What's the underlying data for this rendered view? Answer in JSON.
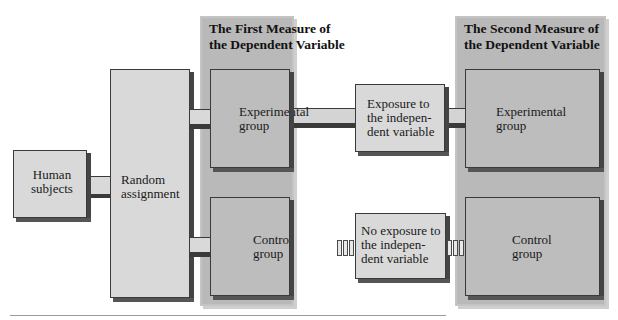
{
  "diagram": {
    "type": "experimental-design-flowchart",
    "nodes": {
      "human_subjects": "Human subjects",
      "random_assignment": "Random assignment",
      "first_measure": {
        "title_line1": "The First Measure of",
        "title_line2": "the Dependent Variable",
        "experimental_line1": "Experimental",
        "experimental_line2": "group",
        "control_line1": "Control",
        "control_line2": "group"
      },
      "exposure": {
        "line1": "Exposure to",
        "line2": "the indepen-",
        "line3": "dent variable"
      },
      "no_exposure": {
        "line1": "No exposure to",
        "line2": "the indepen-",
        "line3": "dent variable"
      },
      "second_measure": {
        "title_line1": "The Second Measure of",
        "title_line2": "the Dependent Variable",
        "experimental_line1": "Experimental",
        "experimental_line2": "group",
        "control_line1": "Control",
        "control_line2": "group"
      }
    },
    "edges": [
      {
        "from": "Human subjects",
        "to": "Random assignment"
      },
      {
        "from": "Random assignment",
        "to": "Experimental group (first measure)"
      },
      {
        "from": "Random assignment",
        "to": "Control group (first measure)"
      },
      {
        "from": "Experimental group (first measure)",
        "to": "Exposure to the independent variable"
      },
      {
        "from": "Exposure to the independent variable",
        "to": "Experimental group (second measure)"
      },
      {
        "from": "Control group (first measure)",
        "to": "No exposure to the independent variable",
        "style": "dashed"
      },
      {
        "from": "No exposure to the independent variable",
        "to": "Control group (second measure)",
        "style": "dashed"
      }
    ]
  }
}
